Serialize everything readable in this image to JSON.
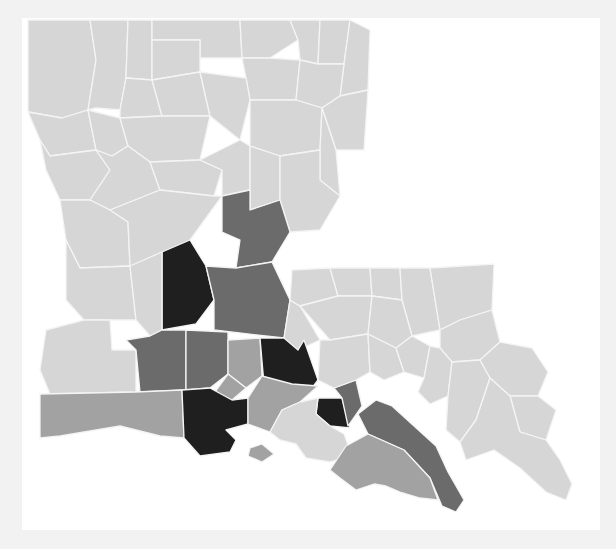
{
  "map": {
    "region": "Louisiana",
    "unit": "parish",
    "type": "choropleth",
    "colors": {
      "background": "#f2f2f2",
      "frame": "#ffffff",
      "border": "#f4f4f4",
      "level_1": "#d6d6d6",
      "level_2": "#a2a2a2",
      "level_3": "#6b6b6b",
      "level_4": "#1f1f1f"
    },
    "parishes": [
      {
        "id": "caddo",
        "level": 1,
        "points": "28,20 90,20 96,60 88,110 62,118 28,112"
      },
      {
        "id": "bossier",
        "level": 1,
        "points": "90,20 128,20 126,78 120,110 96,108 88,110 96,60"
      },
      {
        "id": "webster",
        "level": 1,
        "points": "128,20 152,20 152,80 126,78"
      },
      {
        "id": "claiborne",
        "level": 1,
        "points": "152,20 240,20 242,58 200,58 200,40 152,40"
      },
      {
        "id": "union",
        "level": 1,
        "points": "240,20 290,20 298,40 270,58 242,58"
      },
      {
        "id": "morehouse",
        "level": 1,
        "points": "290,20 320,20 318,64 300,60 298,40"
      },
      {
        "id": "west-carroll",
        "level": 1,
        "points": "320,20 350,20 344,64 318,64"
      },
      {
        "id": "east-carroll",
        "level": 1,
        "points": "350,20 370,30 368,90 340,96 344,64"
      },
      {
        "id": "lincoln",
        "level": 1,
        "points": "152,40 200,40 200,72 152,80"
      },
      {
        "id": "ouachita",
        "level": 1,
        "points": "242,58 270,58 300,60 296,100 250,100 246,78"
      },
      {
        "id": "richland",
        "level": 1,
        "points": "300,60 318,64 344,64 340,96 322,108 296,100"
      },
      {
        "id": "madison",
        "level": 1,
        "points": "340,96 368,90 364,150 336,150 322,108"
      },
      {
        "id": "bienville",
        "level": 1,
        "points": "120,110 126,78 152,80 162,116 120,118"
      },
      {
        "id": "jackson",
        "level": 1,
        "points": "152,80 200,72 210,116 162,116"
      },
      {
        "id": "desoto",
        "level": 1,
        "points": "28,112 62,118 88,110 96,150 50,156 40,140"
      },
      {
        "id": "red-river",
        "level": 1,
        "points": "88,110 120,118 128,146 112,156 96,150"
      },
      {
        "id": "caldwell",
        "level": 1,
        "points": "200,72 246,78 250,100 240,140 210,116"
      },
      {
        "id": "franklin",
        "level": 1,
        "points": "250,100 296,100 322,108 320,150 280,156 250,146"
      },
      {
        "id": "tensas",
        "level": 1,
        "points": "322,108 336,150 340,196 320,180 320,150"
      },
      {
        "id": "winn",
        "level": 1,
        "points": "120,118 162,116 210,116 200,160 150,162 128,146"
      },
      {
        "id": "sabine",
        "level": 1,
        "points": "40,140 50,156 96,150 110,170 90,200 60,200 46,170"
      },
      {
        "id": "natchitoches",
        "level": 1,
        "points": "96,150 112,156 128,146 150,162 160,190 110,210 90,200 110,170"
      },
      {
        "id": "grant",
        "level": 1,
        "points": "150,162 200,160 222,170 214,196 160,190"
      },
      {
        "id": "la-salle",
        "level": 1,
        "points": "200,160 240,140 250,146 250,190 222,196 222,170"
      },
      {
        "id": "catahoula",
        "level": 1,
        "points": "250,146 280,156 280,200 250,210 250,190"
      },
      {
        "id": "concordia",
        "level": 1,
        "points": "280,156 320,150 320,180 340,196 320,230 290,232 280,200"
      },
      {
        "id": "vernon",
        "level": 1,
        "points": "60,200 90,200 110,210 128,222 130,266 80,268 66,240"
      },
      {
        "id": "rapides",
        "level": 1,
        "points": "110,210 160,190 214,196 222,196 190,240 164,260 130,266 128,222"
      },
      {
        "id": "avoyelles",
        "level": 3,
        "points": "222,196 250,190 250,210 280,200 290,232 272,262 236,268 240,240 222,232"
      },
      {
        "id": "evangeline",
        "level": 4,
        "points": "162,252 190,240 206,266 214,300 196,324 162,330"
      },
      {
        "id": "st-landry",
        "level": 3,
        "points": "206,266 236,268 272,262 290,300 284,338 214,330 214,300"
      },
      {
        "id": "beauregard",
        "level": 1,
        "points": "66,240 80,268 130,266 136,320 110,320 84,320 66,300"
      },
      {
        "id": "allen",
        "level": 1,
        "points": "130,266 162,252 162,330 150,336 136,320"
      },
      {
        "id": "calcasieu",
        "level": 1,
        "points": "46,330 84,320 110,320 112,350 136,350 136,392 50,394 40,370"
      },
      {
        "id": "jefferson-davis",
        "level": 3,
        "points": "126,340 150,336 162,330 186,330 186,390 140,392 136,350"
      },
      {
        "id": "acadia",
        "level": 3,
        "points": "186,330 228,332 228,374 210,388 186,390"
      },
      {
        "id": "pointe-coupee",
        "level": 1,
        "points": "284,338 290,300 300,306 320,340 298,350 278,350"
      },
      {
        "id": "st-martin-north",
        "level": 2,
        "points": "228,340 260,338 262,376 246,388 228,374"
      },
      {
        "id": "west-baton-rouge",
        "level": 4,
        "points": "260,338 284,338 298,350 304,340 318,380 312,388 264,384"
      },
      {
        "id": "lafayette",
        "level": 2,
        "points": "228,374 246,388 232,400 212,396"
      },
      {
        "id": "cameron",
        "level": 2,
        "points": "40,394 136,392 182,390 184,438 160,436 120,426 60,436 40,438"
      },
      {
        "id": "vermilion",
        "level": 4,
        "points": "182,390 210,388 232,400 248,398 248,424 226,430 236,440 230,452 200,456 184,438"
      },
      {
        "id": "iberia",
        "level": 2,
        "points": "248,398 262,376 292,384 318,386 300,402 282,410 270,432 248,424"
      },
      {
        "id": "st-mary-island",
        "level": 2,
        "points": "250,448 262,444 274,454 262,462 248,456"
      },
      {
        "id": "ascension",
        "level": 4,
        "points": "318,398 342,398 350,428 330,426 316,414"
      },
      {
        "id": "assumption",
        "level": 3,
        "points": "334,388 356,380 362,406 348,426 342,398"
      },
      {
        "id": "st-mary",
        "level": 1,
        "points": "270,432 282,410 300,402 318,398 316,414 330,426 344,434 352,456 330,462 306,458 296,444 280,440"
      },
      {
        "id": "lafourche",
        "level": 3,
        "points": "358,414 376,400 392,406 436,446 448,472 464,500 456,512 442,506 430,478 404,450 368,434"
      },
      {
        "id": "terrebonne",
        "level": 2,
        "points": "346,446 368,434 404,450 430,478 438,500 420,498 400,492 386,486 374,484 356,490 340,478 330,470"
      },
      {
        "id": "west-feliciana",
        "level": 1,
        "points": "292,270 330,268 338,296 300,306 290,300"
      },
      {
        "id": "east-feliciana",
        "level": 1,
        "points": "330,268 370,268 372,296 338,296"
      },
      {
        "id": "st-helena",
        "level": 1,
        "points": "370,268 400,268 402,300 372,296"
      },
      {
        "id": "tangipahoa",
        "level": 1,
        "points": "400,268 430,268 440,330 412,336 402,300"
      },
      {
        "id": "washington",
        "level": 1,
        "points": "430,268 494,264 492,310 460,320 440,330"
      },
      {
        "id": "east-baton-rouge",
        "level": 1,
        "points": "300,306 338,296 372,296 368,334 330,340"
      },
      {
        "id": "livingston",
        "level": 1,
        "points": "372,296 402,300 412,336 396,348 368,334"
      },
      {
        "id": "st-tammany",
        "level": 1,
        "points": "440,330 460,320 492,310 500,342 480,360 452,362 440,348"
      },
      {
        "id": "iberville",
        "level": 1,
        "points": "320,340 330,340 368,334 370,372 356,380 334,388 318,380"
      },
      {
        "id": "st-james",
        "level": 1,
        "points": "368,334 396,348 404,372 384,380 370,372"
      },
      {
        "id": "st-john",
        "level": 1,
        "points": "396,348 412,336 430,346 424,378 404,372"
      },
      {
        "id": "st-charles",
        "level": 1,
        "points": "424,378 430,346 440,348 452,362 448,396 430,404 418,392"
      },
      {
        "id": "jefferson",
        "level": 1,
        "points": "448,396 452,362 480,360 490,378 476,420 460,442 446,430"
      },
      {
        "id": "orleans",
        "level": 1,
        "points": "480,360 500,342 532,348 548,372 538,396 510,396 490,378"
      },
      {
        "id": "st-bernard",
        "level": 1,
        "points": "510,396 538,396 556,410 546,440 520,432"
      },
      {
        "id": "plaquemines",
        "level": 1,
        "points": "476,420 490,378 510,396 520,432 546,440 560,460 572,484 566,500 546,492 520,468 494,450 466,460 460,442"
      }
    ]
  }
}
